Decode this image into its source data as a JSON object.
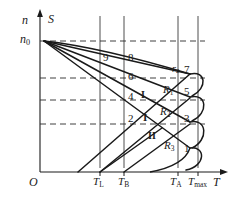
{
  "figure": {
    "axes": {
      "y_label": "n",
      "y_label_secondary": "S",
      "y_origin_label": "n",
      "y_origin_sub": "0",
      "x_label": "T",
      "origin_label": "O"
    },
    "x_ticks": [
      {
        "name": "T-L",
        "label": "T",
        "sub": "L"
      },
      {
        "name": "T-B",
        "label": "T",
        "sub": "B"
      },
      {
        "name": "T-A",
        "label": "T",
        "sub": "A"
      },
      {
        "name": "T-max",
        "label": "T",
        "sub": "max"
      }
    ],
    "region_numbers": [
      {
        "name": "region-9",
        "text": "9"
      },
      {
        "name": "region-8",
        "text": "8"
      },
      {
        "name": "region-7",
        "text": "7"
      },
      {
        "name": "region-6",
        "text": "6"
      },
      {
        "name": "region-5",
        "text": "5"
      },
      {
        "name": "region-4",
        "text": "4"
      },
      {
        "name": "region-3",
        "text": "3"
      },
      {
        "name": "region-2",
        "text": "2"
      },
      {
        "name": "region-1",
        "text": "1"
      }
    ],
    "curve_labels": [
      {
        "name": "curve-r2",
        "label": "r",
        "sub": "2"
      },
      {
        "name": "curve-R1",
        "label": "R",
        "sub": "1"
      },
      {
        "name": "curve-R2",
        "label": "R",
        "sub": "2"
      },
      {
        "name": "curve-R3",
        "label": "R",
        "sub": "3"
      }
    ],
    "roman_numerals": [
      {
        "name": "roman-I-upper",
        "text": "I"
      },
      {
        "name": "roman-I-lower",
        "text": "I"
      },
      {
        "name": "roman-II",
        "text": "II"
      }
    ],
    "colors": {
      "line": "#1a1a1a",
      "grid": "#3a3a3a",
      "dashed": "#2b2b2b",
      "background": "#ffffff"
    }
  }
}
